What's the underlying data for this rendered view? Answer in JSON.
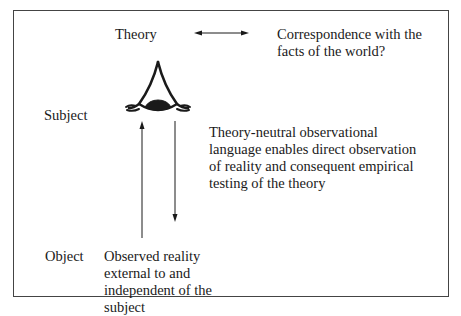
{
  "diagram": {
    "labels": {
      "theory": "Theory",
      "subject": "Subject",
      "object": "Object"
    },
    "correspondence": {
      "lines": [
        "Correspondence with the",
        "facts of the world?"
      ]
    },
    "theory_neutral": {
      "lines": [
        "Theory-neutral observational",
        "language enables direct observation",
        "of reality and consequent empirical",
        "testing of the theory"
      ]
    },
    "observed_reality": {
      "lines": [
        "Observed reality",
        "external to and",
        "independent of the",
        "subject"
      ]
    },
    "icons": {
      "eye": "eye-icon",
      "double_arrow": "double-arrow-icon",
      "up_arrow": "arrow-up-icon",
      "down_arrow": "arrow-down-icon"
    },
    "colors": {
      "ink": "#1a1a1a",
      "frame": "#444444",
      "background": "#ffffff"
    }
  }
}
